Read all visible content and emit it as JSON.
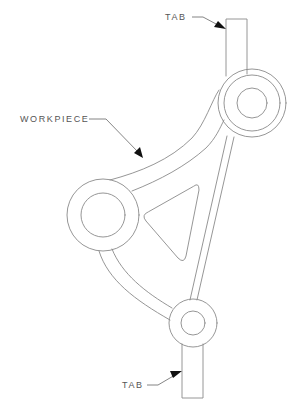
{
  "diagram": {
    "type": "technical-line-drawing",
    "partial_caption": "",
    "labels": {
      "top_tab": "TAB",
      "workpiece": "WORKPIECE",
      "bottom_tab": "TAB"
    },
    "stroke_color": "#8a8a8a",
    "label_color": "#555555",
    "arrow_color": "#111111",
    "components": {
      "top_tab": {
        "x": 226,
        "y": 19,
        "width": 21,
        "height": 60
      },
      "top_boss": {
        "cx": 252,
        "cy": 103,
        "r_outer": 34,
        "r_middle": 28,
        "r_inner": 15
      },
      "left_boss": {
        "cx": 103,
        "cy": 215,
        "r_outer": 36,
        "r_inner": 22
      },
      "bottom_boss": {
        "cx": 193,
        "cy": 323,
        "r_outer": 24,
        "r_inner": 12
      },
      "bottom_tab": {
        "x": 182,
        "y": 340,
        "width": 21,
        "height": 58
      },
      "triangular_cutout": {
        "points": [
          [
            198,
            184
          ],
          [
            143,
            215
          ],
          [
            183,
            262
          ]
        ]
      }
    }
  }
}
